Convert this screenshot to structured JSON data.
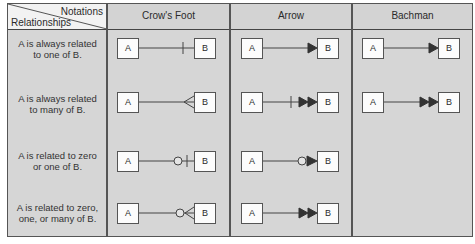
{
  "table": {
    "corner": {
      "top_label": "Notations",
      "bottom_label": "Relationships"
    },
    "columns": [
      {
        "label": "Crow's Foot"
      },
      {
        "label": "Arrow"
      },
      {
        "label": "Bachman"
      }
    ],
    "rows": [
      {
        "relationship": [
          "A is always related",
          "to one of B."
        ],
        "crows_foot": "one (single bar)",
        "arrow": "single arrowhead",
        "bachman": "single arrowhead"
      },
      {
        "relationship": [
          "A is always related",
          "to many of B."
        ],
        "crows_foot": "many (crow's foot)",
        "arrow": "bar + double arrowhead",
        "bachman": "double arrowhead"
      },
      {
        "relationship": [
          "A is related to zero",
          "or one of B."
        ],
        "crows_foot": "circle + bar",
        "arrow": "circle + single arrowhead",
        "bachman": ""
      },
      {
        "relationship": [
          "A is related to zero,",
          "one, or many of B."
        ],
        "crows_foot": "circle + crow's foot",
        "arrow": "double arrowhead",
        "bachman": ""
      }
    ],
    "entity_a": "A",
    "entity_b": "B"
  },
  "colors": {
    "cell_bg": "#d6d6d6",
    "corner_bg": "#f2f2f2",
    "line": "#444444",
    "entity_bg": "#fcfcfc"
  }
}
